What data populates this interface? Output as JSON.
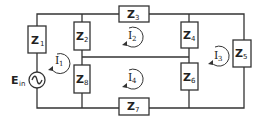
{
  "diagram": {
    "type": "circuit-mesh",
    "source": {
      "label": "E",
      "subscript": "in",
      "symbol": "ac-source"
    },
    "impedances": [
      {
        "id": "Z1",
        "label": "Z",
        "subscript": "1"
      },
      {
        "id": "Z2",
        "label": "Z",
        "subscript": "2"
      },
      {
        "id": "Z3",
        "label": "Z",
        "subscript": "3"
      },
      {
        "id": "Z4",
        "label": "Z",
        "subscript": "4"
      },
      {
        "id": "Z5",
        "label": "Z",
        "subscript": "5"
      },
      {
        "id": "Z6",
        "label": "Z",
        "subscript": "6"
      },
      {
        "id": "Z7",
        "label": "Z",
        "subscript": "7"
      },
      {
        "id": "Z8",
        "label": "Z",
        "subscript": "8"
      }
    ],
    "mesh_currents": [
      {
        "id": "I1",
        "label": "I",
        "subscript": "1",
        "direction": "clockwise"
      },
      {
        "id": "I2",
        "label": "I",
        "subscript": "2",
        "direction": "clockwise"
      },
      {
        "id": "I3",
        "label": "I",
        "subscript": "3",
        "direction": "clockwise"
      },
      {
        "id": "I4",
        "label": "I",
        "subscript": "4",
        "direction": "clockwise"
      }
    ]
  }
}
